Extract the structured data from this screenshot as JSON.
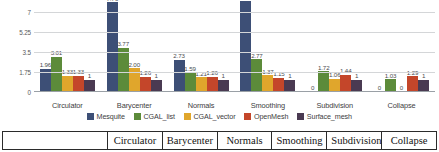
{
  "chart_data": {
    "type": "bar",
    "title": "",
    "xlabel": "",
    "ylabel": "",
    "ylim": [
      0,
      7.875
    ],
    "yticks": [
      "0",
      "1.75",
      "3.5",
      "5.25",
      "7"
    ],
    "ytick_values": [
      0,
      1.75,
      3.5,
      5.25,
      7
    ],
    "grid": true,
    "legend_position": "bottom",
    "categories": [
      "Circulator",
      "Barycenter",
      "Normals",
      "Smoothing",
      "Subdivision",
      "Collapse"
    ],
    "series": [
      {
        "name": "Mesquite",
        "color": "#3d4f76",
        "values": [
          1.96,
          7.76,
          2.73,
          12.94,
          0,
          0
        ],
        "labels": [
          "1.96",
          "7.76",
          "2.73",
          "12.94",
          "0",
          "0"
        ]
      },
      {
        "name": "CGAL_list",
        "color": "#5c8b3a",
        "values": [
          3.01,
          3.77,
          1.59,
          2.77,
          1.72,
          1.03
        ],
        "labels": [
          "3.01",
          "3.77",
          "1.59",
          "2.77",
          "1.72",
          "1.03"
        ]
      },
      {
        "name": "CGAL_vector",
        "color": "#e0a62c",
        "values": [
          1.33,
          2.0,
          1.21,
          1.37,
          1.06,
          0
        ],
        "labels": [
          "1.33",
          "2.00",
          "1.21",
          "1.37",
          "1.06",
          "0"
        ]
      },
      {
        "name": "OpenMesh",
        "color": "#c4462a",
        "values": [
          1.33,
          1.26,
          1.26,
          1.15,
          1.44,
          1.29
        ],
        "labels": [
          "1.33",
          "1.26",
          "1.26",
          "1.15",
          "1.44",
          "1.29"
        ]
      },
      {
        "name": "Surface_mesh",
        "color": "#4a3a52",
        "values": [
          1,
          1,
          1,
          1,
          1,
          1
        ],
        "labels": [
          "1",
          "1",
          "1",
          "1",
          "1",
          "1"
        ]
      }
    ]
  },
  "legend": {
    "items": [
      {
        "label": "Mesquite",
        "color": "#3d4f76"
      },
      {
        "label": "CGAL_list",
        "color": "#5c8b3a"
      },
      {
        "label": "CGAL_vector",
        "color": "#e0a62c"
      },
      {
        "label": "OpenMesh",
        "color": "#c4462a"
      },
      {
        "label": "Surface_mesh",
        "color": "#4a3a52"
      }
    ]
  },
  "bottom_table": {
    "first_cell": "",
    "headers": [
      "Circulator",
      "Barycenter",
      "Normals",
      "Smoothing",
      "Subdivision",
      "Collapse"
    ]
  }
}
